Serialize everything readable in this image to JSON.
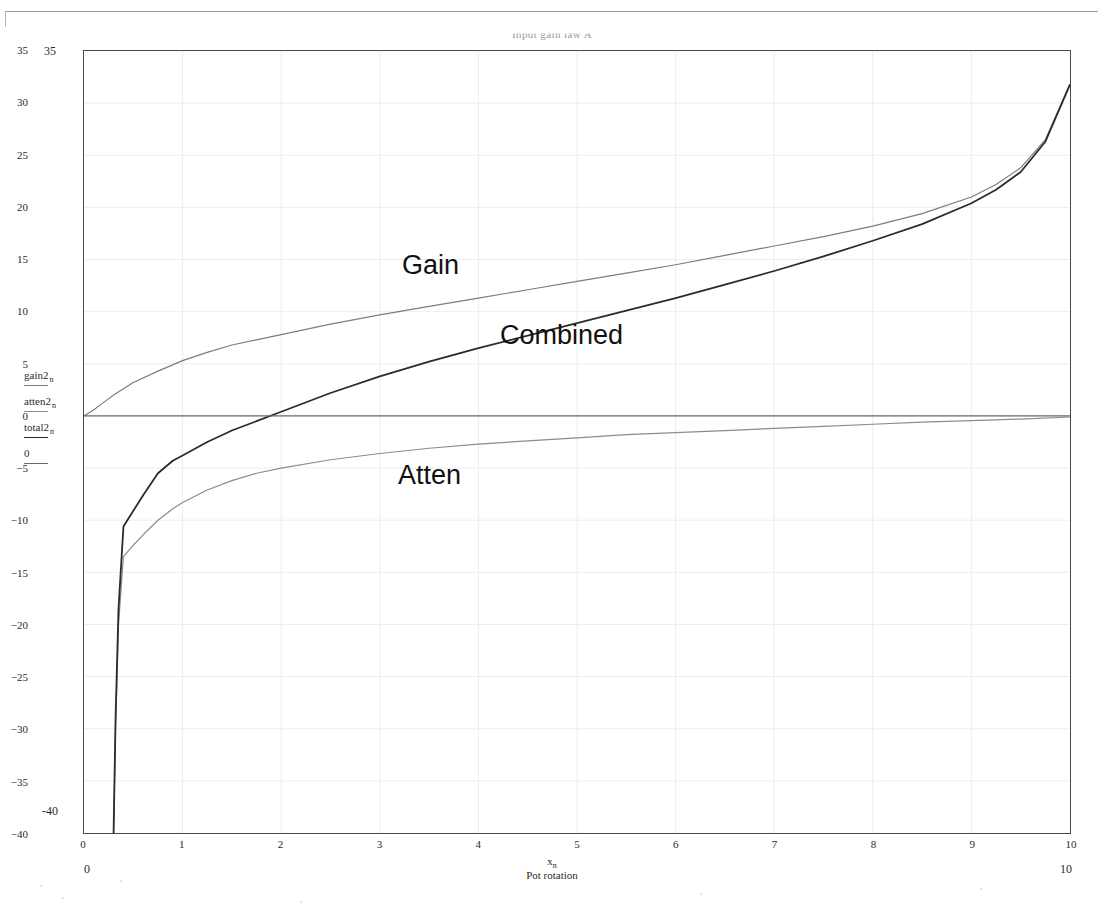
{
  "title": "Input gain law A",
  "legend": {
    "entries": [
      {
        "label": "gain2",
        "sub": "n",
        "swatch": "sw-gain"
      },
      {
        "label": "atten2",
        "sub": "n",
        "swatch": "sw-atten"
      },
      {
        "label": "total2",
        "sub": "n",
        "swatch": "sw-combined"
      },
      {
        "label": "0",
        "sub": "",
        "swatch": "sw-zero"
      }
    ]
  },
  "annotations": {
    "gain": "Gain",
    "combined": "Combined",
    "atten": "Atten"
  },
  "xaxis": {
    "variable": "x",
    "variable_sub": "n",
    "caption": "Pot rotation",
    "range_min": "0",
    "range_max": "10"
  },
  "yaxis": {
    "range_max": "35",
    "range_min": "-40"
  },
  "colors": {
    "gain": "#7d7d7d",
    "atten": "#8c8c8c",
    "combined": "#2b2b2b",
    "zero": "#6b6b6b",
    "grid": "#ededed",
    "frame": "#4a4a4a"
  },
  "chart_data": {
    "type": "line",
    "title": "Input gain law A",
    "xlabel": "Pot rotation",
    "ylabel": "",
    "xlim": [
      0,
      10
    ],
    "ylim": [
      -40,
      35
    ],
    "xticks": [
      0,
      1,
      2,
      3,
      4,
      5,
      6,
      7,
      8,
      9,
      10
    ],
    "yticks": [
      -40,
      -35,
      -30,
      -25,
      -20,
      -15,
      -10,
      -5,
      0,
      5,
      10,
      15,
      20,
      25,
      30,
      35
    ],
    "grid": true,
    "legend_position": "left-outside",
    "series": [
      {
        "name": "Gain",
        "key": "gain2",
        "color": "#7d7d7d",
        "x": [
          0.0,
          0.1,
          0.2,
          0.3,
          0.4,
          0.5,
          0.75,
          1.0,
          1.25,
          1.5,
          1.75,
          2.0,
          2.5,
          3.0,
          3.5,
          4.0,
          4.5,
          5.0,
          5.5,
          6.0,
          6.5,
          7.0,
          7.5,
          8.0,
          8.5,
          9.0,
          9.25,
          9.5,
          9.75,
          10.0
        ],
        "y": [
          0.0,
          0.6,
          1.3,
          2.0,
          2.6,
          3.2,
          4.3,
          5.3,
          6.1,
          6.8,
          7.3,
          7.8,
          8.8,
          9.7,
          10.5,
          11.3,
          12.1,
          12.9,
          13.7,
          14.5,
          15.4,
          16.3,
          17.2,
          18.2,
          19.4,
          21.0,
          22.2,
          23.8,
          26.5,
          31.8
        ]
      },
      {
        "name": "Atten",
        "key": "atten2",
        "color": "#8c8c8c",
        "x": [
          0.3,
          0.32,
          0.35,
          0.4,
          0.5,
          0.6,
          0.75,
          0.9,
          1.0,
          1.25,
          1.5,
          1.75,
          2.0,
          2.5,
          3.0,
          3.5,
          4.0,
          4.5,
          5.0,
          5.5,
          6.0,
          6.5,
          7.0,
          7.5,
          8.0,
          8.5,
          9.0,
          9.5,
          10.0
        ],
        "y": [
          -40.0,
          -30.0,
          -20.0,
          -13.5,
          -12.4,
          -11.4,
          -10.0,
          -8.9,
          -8.3,
          -7.1,
          -6.2,
          -5.5,
          -5.0,
          -4.2,
          -3.6,
          -3.1,
          -2.7,
          -2.4,
          -2.1,
          -1.8,
          -1.6,
          -1.4,
          -1.2,
          -1.0,
          -0.8,
          -0.6,
          -0.45,
          -0.3,
          -0.1
        ]
      },
      {
        "name": "Combined",
        "key": "total2",
        "color": "#2b2b2b",
        "x": [
          0.3,
          0.32,
          0.35,
          0.4,
          0.5,
          0.6,
          0.75,
          0.9,
          1.0,
          1.25,
          1.5,
          1.75,
          2.0,
          2.5,
          3.0,
          3.5,
          4.0,
          4.5,
          5.0,
          5.5,
          6.0,
          6.5,
          7.0,
          7.5,
          8.0,
          8.5,
          9.0,
          9.25,
          9.5,
          9.75,
          10.0
        ],
        "y": [
          -40.0,
          -29.0,
          -18.5,
          -10.6,
          -9.1,
          -7.6,
          -5.5,
          -4.3,
          -3.8,
          -2.5,
          -1.4,
          -0.5,
          0.4,
          2.2,
          3.8,
          5.2,
          6.5,
          7.7,
          8.9,
          10.1,
          11.3,
          12.6,
          13.9,
          15.3,
          16.8,
          18.4,
          20.4,
          21.7,
          23.4,
          26.3,
          31.8
        ]
      },
      {
        "name": "Zero reference",
        "key": "0",
        "color": "#6b6b6b",
        "x": [
          0,
          10
        ],
        "y": [
          0,
          0
        ]
      }
    ]
  }
}
